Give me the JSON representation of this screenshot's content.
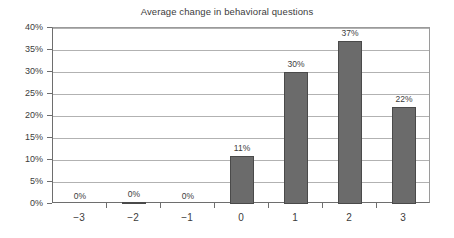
{
  "chart_data": {
    "type": "bar",
    "title": "Average change in behavioral questions",
    "xlabel": "",
    "ylabel": "",
    "categories": [
      "−3",
      "−2",
      "−1",
      "0",
      "1",
      "2",
      "3"
    ],
    "values": [
      0,
      0,
      0,
      11,
      30,
      37,
      22
    ],
    "bar_render_values": [
      0,
      0.55,
      0,
      11,
      30,
      37,
      22
    ],
    "data_labels": [
      "0%",
      "0%",
      "0%",
      "11%",
      "30%",
      "37%",
      "22%"
    ],
    "ylim": [
      0,
      40
    ],
    "ytick_values": [
      40,
      35,
      30,
      25,
      20,
      15,
      10,
      5,
      0
    ],
    "ytick_labels": [
      "40%",
      "35%",
      "30%",
      "25%",
      "20%",
      "15%",
      "10%",
      "5%",
      "0%"
    ],
    "grid": true,
    "grid_axis": "y",
    "legend": false,
    "legend_position": "none",
    "colors": {
      "bar_fill": "#6b6b6b",
      "bar_border": "#4a4a4a",
      "gridline": "#b2b2b2",
      "axis": "#6e6e6e",
      "text": "#3c3c3c",
      "background": "#ffffff"
    }
  }
}
